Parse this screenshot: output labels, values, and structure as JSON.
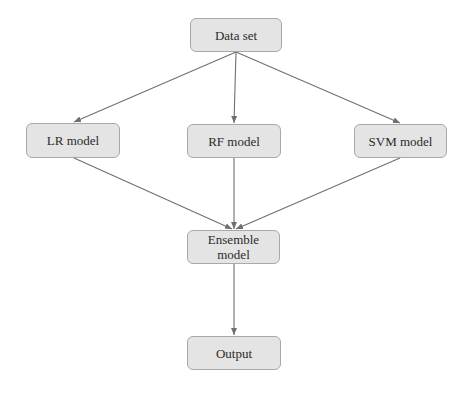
{
  "diagram": {
    "type": "flowchart",
    "colors": {
      "node_fill": "#e4e4e4",
      "node_border": "#a9a9a9",
      "edge": "#6f6f6f",
      "text": "#2b2b2b"
    },
    "nodes": [
      {
        "id": "dataset",
        "label": "Data set"
      },
      {
        "id": "lr",
        "label": "LR model"
      },
      {
        "id": "rf",
        "label": "RF model"
      },
      {
        "id": "svm",
        "label": "SVM model"
      },
      {
        "id": "ensemble",
        "label_line1": "Ensemble",
        "label_line2": "model"
      },
      {
        "id": "output",
        "label": "Output"
      }
    ],
    "edges": [
      {
        "from": "dataset",
        "to": "lr"
      },
      {
        "from": "dataset",
        "to": "rf"
      },
      {
        "from": "dataset",
        "to": "svm"
      },
      {
        "from": "lr",
        "to": "ensemble"
      },
      {
        "from": "rf",
        "to": "ensemble"
      },
      {
        "from": "svm",
        "to": "ensemble"
      },
      {
        "from": "ensemble",
        "to": "output"
      }
    ]
  }
}
